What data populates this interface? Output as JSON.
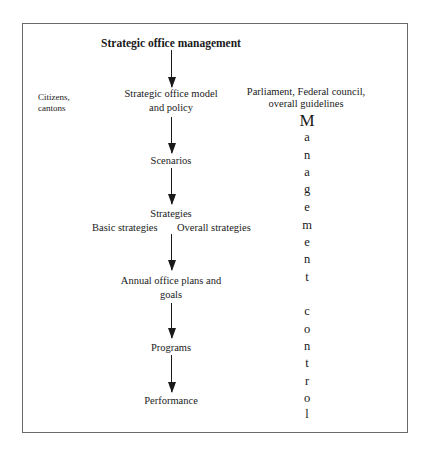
{
  "diagram": {
    "title": "Strategic office management",
    "left_label": [
      "Citizens,",
      "cantons"
    ],
    "flow": [
      {
        "lines": [
          "Strategic office model",
          "and policy"
        ]
      },
      {
        "lines": [
          "Scenarios"
        ]
      },
      {
        "lines": [
          "Strategies"
        ],
        "sub": {
          "left": "Basic strategies",
          "right": "Overall strategies"
        }
      },
      {
        "lines": [
          "Annual office plans and",
          "goals"
        ]
      },
      {
        "lines": [
          "Programs"
        ]
      },
      {
        "lines": [
          "Performance"
        ]
      }
    ],
    "right_header": [
      "Parliament, Federal council,",
      "overall guidelines"
    ],
    "vertical_word_1": [
      "M",
      "a",
      "n",
      "a",
      "g",
      "e",
      "m",
      "e",
      "n",
      "t"
    ],
    "vertical_word_2": [
      "c",
      "o",
      "n",
      "t",
      "r",
      "o",
      "l"
    ],
    "colors": {
      "ink": "#1a1a1a",
      "frame": "#6a6a6a",
      "background": "#ffffff"
    }
  }
}
